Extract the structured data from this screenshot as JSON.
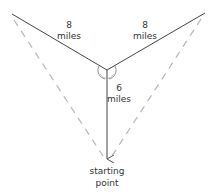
{
  "diagram": {
    "segments": [
      {
        "id": "left-leg",
        "length_label": "8",
        "unit": "miles",
        "style": "solid"
      },
      {
        "id": "right-leg",
        "length_label": "8",
        "unit": "miles",
        "style": "solid"
      },
      {
        "id": "center-leg",
        "length_label": "6",
        "unit": "miles",
        "style": "solid-arrow"
      }
    ],
    "labels": {
      "left_value": "8",
      "left_unit": "miles",
      "right_value": "8",
      "right_unit": "miles",
      "center_value": "6",
      "center_unit": "miles",
      "start_line1": "starting",
      "start_line2": "point"
    },
    "colors": {
      "solid_line": "#444444",
      "dashed_line": "#b0b0b0",
      "text": "#333333"
    }
  }
}
